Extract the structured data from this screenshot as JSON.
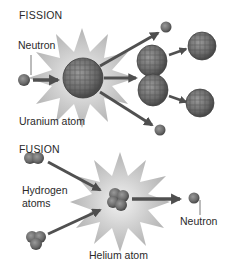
{
  "fission": {
    "title": "FISSION",
    "neutron_label": "Neutron",
    "uranium_label": "Uranium atom"
  },
  "fusion": {
    "title": "FUSION",
    "hydrogen_label_line1": "Hydrogen",
    "hydrogen_label_line2": "atoms",
    "helium_label": "Helium atom",
    "neutron_label": "Neutron"
  },
  "colors": {
    "background": "#ffffff",
    "starburst": "#c8c8c8",
    "nucleus": "#6e6e6e",
    "nucleus_dark": "#4a4a4a",
    "arrow": "#505050",
    "text": "#2a2a2a"
  }
}
